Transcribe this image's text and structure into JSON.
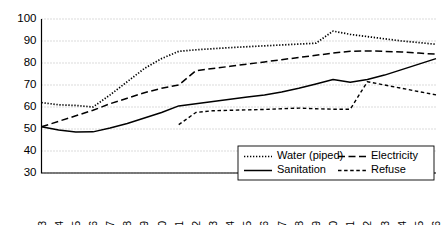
{
  "chart_data": {
    "type": "line",
    "title": "",
    "xlabel": "",
    "ylabel": "",
    "ylim": [
      30,
      100
    ],
    "ytick_step": 10,
    "grid": true,
    "legend_position": "bottom-right",
    "yticks": [
      "100",
      "90",
      "80",
      "70",
      "60",
      "50",
      "40",
      "30"
    ],
    "categories": [
      "1993",
      "1994",
      "1995",
      "1996",
      "1997",
      "1998",
      "1999",
      "2000",
      "2001",
      "2002",
      "2003",
      "2004",
      "2005",
      "2006",
      "2007",
      "2008",
      "2009",
      "2010",
      "2011",
      "2012",
      "2013",
      "2014",
      "2015",
      "2016"
    ],
    "series": [
      {
        "name": "Water (piped)",
        "style": "dotted",
        "values": [
          62.0,
          61.0,
          60.7,
          60.0,
          65.5,
          71.5,
          77.5,
          82.0,
          85.3,
          86.0,
          86.5,
          87.0,
          87.4,
          87.8,
          88.2,
          88.6,
          89.0,
          94.5,
          93.0,
          92.0,
          91.0,
          90.0,
          89.3,
          88.5
        ]
      },
      {
        "name": "Electricity",
        "style": "long-dash",
        "values": [
          51.0,
          53.5,
          56.0,
          58.5,
          61.5,
          64.0,
          66.5,
          68.5,
          70.0,
          76.5,
          77.5,
          78.5,
          79.5,
          80.5,
          81.5,
          82.5,
          83.5,
          84.5,
          85.3,
          85.5,
          85.3,
          85.0,
          84.5,
          84.0
        ]
      },
      {
        "name": "Sanitation",
        "style": "solid",
        "values": [
          51.0,
          49.5,
          48.6,
          48.7,
          50.5,
          52.5,
          55.0,
          57.5,
          60.5,
          61.5,
          62.5,
          63.5,
          64.5,
          65.5,
          66.8,
          68.5,
          70.5,
          72.5,
          71.3,
          72.5,
          74.5,
          77.0,
          79.5,
          82.0
        ]
      },
      {
        "name": "Refuse",
        "style": "short-dash",
        "values": [
          null,
          null,
          null,
          null,
          null,
          null,
          null,
          null,
          52.0,
          57.5,
          58.3,
          58.5,
          58.7,
          58.9,
          59.2,
          59.5,
          59.2,
          59.0,
          59.0,
          71.5,
          70.0,
          68.5,
          67.0,
          65.5
        ]
      }
    ],
    "legend": [
      {
        "label": "Water (piped)",
        "style": "dotted"
      },
      {
        "label": "Electricity",
        "style": "long-dash"
      },
      {
        "label": "Sanitation",
        "style": "solid"
      },
      {
        "label": "Refuse",
        "style": "short-dash"
      }
    ],
    "colors": {
      "line": "#000000",
      "grid": "#9a9a9a",
      "axis": "#000000",
      "background": "#ffffff"
    }
  }
}
